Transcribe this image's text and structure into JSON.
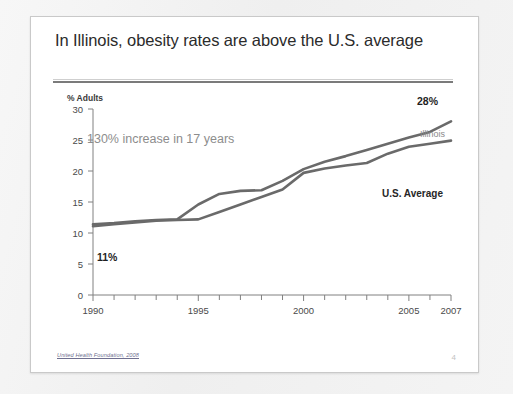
{
  "slide": {
    "title": "In Illinois, obesity rates are above the U.S. average",
    "source_note": "United Health Foundation, 2008",
    "slide_number": "4",
    "colors": {
      "backdrop": "#f3f3f3",
      "slide_background": "#ffffff",
      "slide_border": "#c9c9c9",
      "rule_thin": "#cfcfcf",
      "rule_thick": "#7b7b7b",
      "title_text": "#2b2b2b",
      "annotation_text": "#8d8d8d",
      "series_line": "#6a6a6a",
      "axis": "#808080"
    }
  },
  "chart_data": {
    "type": "line",
    "title": "",
    "xlabel": "",
    "ylabel": "% Adults",
    "ylim": [
      0,
      30
    ],
    "xlim": [
      1990,
      2007
    ],
    "yticks": [
      0,
      5,
      10,
      15,
      20,
      25,
      30
    ],
    "xticks": [
      1990,
      1995,
      2000,
      2005,
      2007
    ],
    "xtick_labels": [
      "1990",
      "1995",
      "2000",
      "2005",
      "2007"
    ],
    "minor_xticks": [
      1991,
      1992,
      1993,
      1994,
      1996,
      1997,
      1998,
      1999,
      2001,
      2002,
      2003,
      2004,
      2006
    ],
    "grid": false,
    "legend": "inline-right",
    "x": [
      1990,
      1991,
      1992,
      1993,
      1994,
      1995,
      1996,
      1997,
      1998,
      1999,
      2000,
      2001,
      2002,
      2003,
      2004,
      2005,
      2006,
      2007
    ],
    "series": [
      {
        "name": "Illinois",
        "color": "#6a6a6a",
        "values": [
          11.4,
          11.6,
          11.9,
          12.1,
          12.2,
          14.6,
          16.3,
          16.8,
          16.9,
          18.4,
          20.3,
          21.5,
          22.4,
          23.4,
          24.4,
          25.4,
          26.3,
          28.0
        ]
      },
      {
        "name": "U.S. Average",
        "color": "#6a6a6a",
        "values": [
          11.1,
          11.4,
          11.7,
          12.0,
          12.1,
          12.2,
          13.4,
          14.6,
          15.8,
          17.0,
          19.7,
          20.4,
          20.9,
          21.3,
          22.8,
          23.9,
          24.4,
          24.9
        ]
      }
    ],
    "annotations": [
      {
        "name": "increase-annotation",
        "text": "130% increase in 17 years"
      },
      {
        "name": "start-value-label",
        "text": "11%"
      },
      {
        "name": "end-value-label",
        "text": "28%"
      }
    ],
    "series_labels": [
      {
        "name": "illinois",
        "text": "Illinois"
      },
      {
        "name": "us-average",
        "text": "U.S. Average"
      }
    ]
  }
}
